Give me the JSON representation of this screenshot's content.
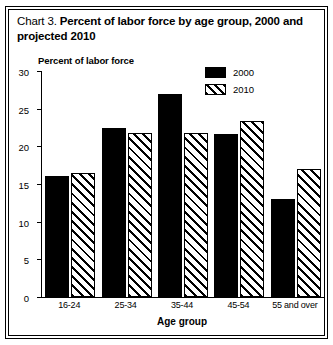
{
  "figure": {
    "title_lead": "Chart 3.",
    "title_main": "Percent of labor force by age group, 2000 and projected 2010"
  },
  "chart_data": {
    "type": "bar",
    "title": "Chart 3.  Percent of labor force by age group, 2000 and projected 2010",
    "xlabel": "Age group",
    "ylabel": "Percent of labor force",
    "ylim": [
      0,
      30
    ],
    "yticks": [
      0,
      5,
      10,
      15,
      20,
      25,
      30
    ],
    "ytick_labels": [
      "0",
      "5",
      "10",
      "15",
      "20",
      "25",
      "30"
    ],
    "categories": [
      "16-24",
      "25-34",
      "35-44",
      "45-54",
      "55 and over"
    ],
    "series": [
      {
        "name": "2000",
        "style": "solid",
        "color": "#000000",
        "values": [
          16.0,
          22.5,
          27.0,
          21.6,
          13.0
        ]
      },
      {
        "name": "2010",
        "style": "diagonal-hatch",
        "color": "#000000",
        "values": [
          16.5,
          21.8,
          21.8,
          23.4,
          17.0
        ]
      }
    ],
    "grid": false,
    "legend_position": "upper-right-inside"
  }
}
